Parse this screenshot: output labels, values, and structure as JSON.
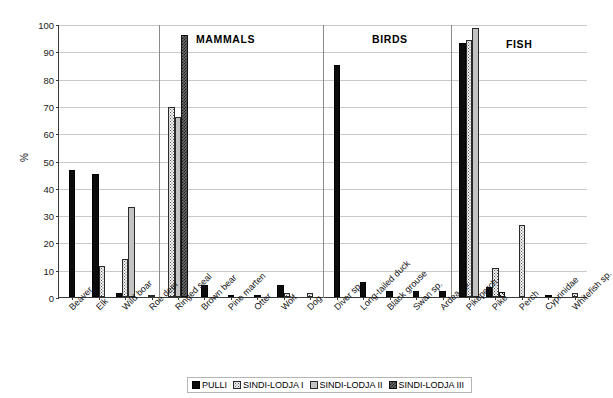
{
  "chart_data": {
    "type": "bar",
    "title": "",
    "xlabel": "",
    "ylabel": "%",
    "ylim": [
      0,
      100
    ],
    "ytick_labels": [
      "0",
      "10",
      "20",
      "30",
      "40",
      "50",
      "60",
      "70",
      "80",
      "90",
      "100"
    ],
    "grid": true,
    "legend_position": "bottom",
    "categories": [
      "Beaver",
      "Elk",
      "Wild boar",
      "Roe deer",
      "Ringed seal",
      "Brown bear",
      "Pine marten",
      "Otter",
      "Wolf",
      "Dog",
      "Diver sp.",
      "Long-tailed duck",
      "Black grouse",
      "Swan sp.",
      "Ardea sp.",
      "Pikeperch",
      "Pike",
      "Perch",
      "Cyprinidae",
      "Whitefish sp."
    ],
    "series": [
      {
        "name": "PULLI",
        "pattern": "solid-black",
        "color": "#0c0c0c",
        "values": [
          46.5,
          45,
          1.5,
          0,
          0,
          4.5,
          0.7,
          0.5,
          4.3,
          0,
          85,
          5.5,
          2.3,
          2.3,
          2.3,
          93,
          3.5,
          0,
          0.8,
          0
        ]
      },
      {
        "name": "SINDI-LODJA I",
        "pattern": "fine-dotted",
        "color": "#f4f4f4",
        "values": [
          0,
          11.5,
          14,
          0.5,
          69.5,
          0,
          0,
          0,
          1.3,
          1.5,
          0,
          0,
          0,
          0,
          0,
          94,
          10.5,
          26.5,
          0,
          1.5
        ]
      },
      {
        "name": "SINDI-LODJA II",
        "pattern": "solid-light-gray",
        "color": "#c3c3c3",
        "values": [
          0,
          0,
          33,
          0,
          66,
          0,
          0,
          0,
          0,
          0,
          0,
          0,
          0,
          0,
          0,
          98.5,
          0,
          0,
          0,
          0
        ]
      },
      {
        "name": "SINDI-LODJA III",
        "pattern": "dark-crosshatch",
        "color": "#6d6d6d",
        "values": [
          0,
          0,
          0,
          0,
          96,
          0,
          0,
          0,
          0,
          0,
          0,
          0,
          0,
          0,
          0,
          0,
          2,
          0,
          0,
          0
        ]
      }
    ],
    "annotations": [
      {
        "text": "MAMMALS",
        "x_left_px": 196,
        "y_top_px": 33
      },
      {
        "text": "BIRDS",
        "x_left_px": 372,
        "y_top_px": 33
      },
      {
        "text": "FISH",
        "x_left_px": 506,
        "y_top_px": 38
      }
    ],
    "section_dividers_px": [
      158,
      322,
      450
    ]
  },
  "legend": {
    "items": [
      {
        "label": "PULLI",
        "pattern": "solid-black"
      },
      {
        "label": "SINDI-LODJA I",
        "pattern": "fine-dotted"
      },
      {
        "label": "SINDI-LODJA II",
        "pattern": "solid-light-gray"
      },
      {
        "label": "SINDI-LODJA III",
        "pattern": "dark-crosshatch"
      }
    ]
  }
}
